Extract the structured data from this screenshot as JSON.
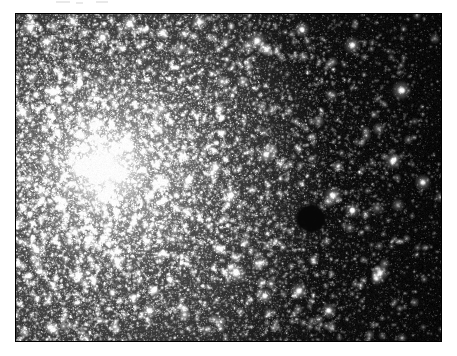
{
  "page": {
    "width": 457,
    "height": 356,
    "background_color": "#ffffff"
  },
  "figure": {
    "name": "globular-cluster-image",
    "frame": {
      "x": 15,
      "y": 13,
      "width": 427,
      "height": 329
    },
    "border_color": "#000000",
    "colors": {
      "background_sky": "#000000",
      "sky_min": "#0a0a0a",
      "sky_max": "#6e6e6e",
      "star_bright": "#ffffff",
      "star_mid": "#cfcfcf",
      "star_faint": "#8a8a8a",
      "occulting_spot": "#070707"
    }
  },
  "starfield": {
    "type": "point-cloud",
    "seed": 20240517,
    "description": "Grayscale globular cluster: brightness peaks left-of-center and falls off toward the right edge",
    "core": {
      "cx": 0.245,
      "cy": 0.5,
      "radius": 0.44,
      "peak_brightness": 0.95
    },
    "glow_layers": [
      {
        "cx": 0.245,
        "cy": 0.5,
        "r": 0.5,
        "alpha": 0.55,
        "color": "#9a9a9a"
      },
      {
        "cx": 0.21,
        "cy": 0.47,
        "r": 0.26,
        "alpha": 0.45,
        "color": "#b4b4b4"
      },
      {
        "cx": 0.2,
        "cy": 0.46,
        "r": 0.12,
        "alpha": 0.4,
        "color": "#cdcdcd"
      }
    ],
    "gradient": {
      "direction": "left-to-right",
      "left_level": 0.62,
      "right_level": 0.1
    },
    "star_counts": {
      "faint_dust": 26000,
      "small": 5200,
      "medium": 900,
      "bright": 150,
      "very_bright": 34
    },
    "bright_star_positions": [
      {
        "x": 0.035,
        "y": 0.045,
        "r": 2.3
      },
      {
        "x": 0.075,
        "y": 0.088,
        "r": 2.0
      },
      {
        "x": 0.135,
        "y": 0.026,
        "r": 1.9
      },
      {
        "x": 0.205,
        "y": 0.075,
        "r": 2.1
      },
      {
        "x": 0.268,
        "y": 0.033,
        "r": 2.2
      },
      {
        "x": 0.345,
        "y": 0.06,
        "r": 1.8
      },
      {
        "x": 0.432,
        "y": 0.028,
        "r": 2.0
      },
      {
        "x": 0.567,
        "y": 0.085,
        "r": 2.4
      },
      {
        "x": 0.672,
        "y": 0.05,
        "r": 2.0
      },
      {
        "x": 0.79,
        "y": 0.098,
        "r": 2.2
      },
      {
        "x": 0.905,
        "y": 0.235,
        "r": 2.5
      },
      {
        "x": 0.018,
        "y": 0.3,
        "r": 2.4
      },
      {
        "x": 0.088,
        "y": 0.24,
        "r": 2.6
      },
      {
        "x": 0.186,
        "y": 0.342,
        "r": 2.1
      },
      {
        "x": 0.262,
        "y": 0.398,
        "r": 2.0
      },
      {
        "x": 0.15,
        "y": 0.47,
        "r": 2.3
      },
      {
        "x": 0.207,
        "y": 0.56,
        "r": 2.0
      },
      {
        "x": 0.345,
        "y": 0.515,
        "r": 2.1
      },
      {
        "x": 0.47,
        "y": 0.47,
        "r": 2.0
      },
      {
        "x": 0.505,
        "y": 0.555,
        "r": 2.3
      },
      {
        "x": 0.588,
        "y": 0.43,
        "r": 2.1
      },
      {
        "x": 0.745,
        "y": 0.555,
        "r": 2.4
      },
      {
        "x": 0.79,
        "y": 0.6,
        "r": 2.0
      },
      {
        "x": 0.885,
        "y": 0.45,
        "r": 2.2
      },
      {
        "x": 0.955,
        "y": 0.515,
        "r": 2.1
      },
      {
        "x": 0.05,
        "y": 0.72,
        "r": 2.2
      },
      {
        "x": 0.148,
        "y": 0.8,
        "r": 2.3
      },
      {
        "x": 0.24,
        "y": 0.755,
        "r": 2.0
      },
      {
        "x": 0.315,
        "y": 0.905,
        "r": 2.1
      },
      {
        "x": 0.518,
        "y": 0.79,
        "r": 2.6
      },
      {
        "x": 0.585,
        "y": 0.86,
        "r": 2.0
      },
      {
        "x": 0.665,
        "y": 0.845,
        "r": 2.3
      },
      {
        "x": 0.735,
        "y": 0.905,
        "r": 2.0
      },
      {
        "x": 0.855,
        "y": 0.79,
        "r": 2.2
      }
    ]
  },
  "occulting_spot": {
    "name": "dark-circular-spot",
    "cx": 0.693,
    "cy": 0.625,
    "rx": 0.038,
    "ry": 0.047,
    "fill": "#070707",
    "edge_softness": 0.22
  },
  "residual_marks": [
    {
      "x": 56,
      "y": 1,
      "width": 14
    },
    {
      "x": 96,
      "y": 1,
      "width": 12
    },
    {
      "x": 76,
      "y": 2,
      "width": 7
    }
  ]
}
